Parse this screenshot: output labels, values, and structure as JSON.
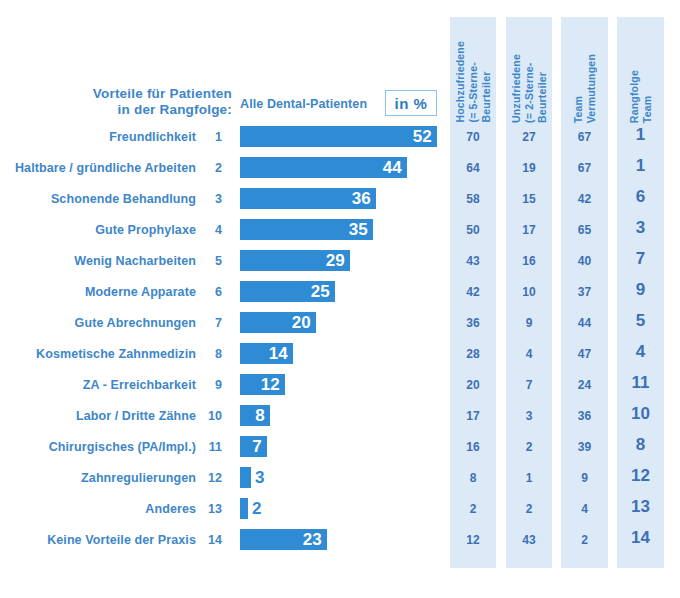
{
  "title": {
    "line1": "Vorteile für Patienten",
    "line2": "in der Rangfolge:"
  },
  "series_label": "Alle Dental-Patienten",
  "unit_label": "in %",
  "column_headers": [
    "Hochzufriedene\n(= 5-Sterne-\nBeurteiler",
    "Unzufriedene\n(= 2-Sterne-\nBeurteiler",
    "Team\nVermutungen",
    "Rangfolge\nTeam"
  ],
  "column_headers_lines": [
    [
      "Hochzufriedene",
      "(= 5-Sterne-",
      "Beurteiler"
    ],
    [
      "Unzufriedene",
      "(= 2-Sterne-",
      "Beurteiler"
    ],
    [
      "Team",
      "Vermutungen"
    ],
    [
      "Rangfolge",
      "Team"
    ]
  ],
  "colors": {
    "bar": "#2E8BD4",
    "label_text": "#3E86C8",
    "column_bg": "#DCEAF7",
    "column_text": "#3E6FB5",
    "unit_border": "#8FC2E8",
    "value_inside": "#ffffff"
  },
  "chart_data": {
    "type": "bar",
    "title": "Vorteile für Patienten in der Rangfolge:",
    "xlabel": "",
    "ylabel": "",
    "unit": "in %",
    "orientation": "horizontal",
    "xlim": [
      0,
      55
    ],
    "grid": false,
    "legend": "none",
    "categories": [
      "Freundlichkeit",
      "Haltbare / gründliche Arbeiten",
      "Schonende Behandlung",
      "Gute Prophylaxe",
      "Wenig Nacharbeiten",
      "Moderne Apparate",
      "Gute Abrechnungen",
      "Kosmetische Zahnmedizin",
      "ZA - Erreichbarkeit",
      "Labor / Dritte Zähne",
      "Chirurgisches (PA/Impl.)",
      "Zahnregulierungen",
      "Anderes",
      "Keine Vorteile der Praxis"
    ],
    "rank_numbers": [
      1,
      2,
      3,
      4,
      5,
      6,
      7,
      8,
      9,
      10,
      11,
      12,
      13,
      14
    ],
    "series": [
      {
        "name": "Alle Dental-Patienten",
        "values": [
          52,
          44,
          36,
          35,
          29,
          25,
          20,
          14,
          12,
          8,
          7,
          3,
          2,
          23
        ]
      },
      {
        "name": "Hochzufriedene (= 5-Sterne-Beurteiler",
        "values": [
          70,
          64,
          58,
          50,
          43,
          42,
          36,
          28,
          20,
          17,
          16,
          8,
          2,
          12
        ]
      },
      {
        "name": "Unzufriedene (= 2-Sterne-Beurteiler",
        "values": [
          27,
          19,
          15,
          17,
          16,
          10,
          9,
          4,
          7,
          3,
          2,
          1,
          2,
          43
        ]
      },
      {
        "name": "Team Vermutungen",
        "values": [
          67,
          67,
          42,
          65,
          40,
          37,
          44,
          47,
          24,
          36,
          39,
          9,
          4,
          2
        ]
      },
      {
        "name": "Rangfolge Team",
        "values": [
          1,
          1,
          6,
          3,
          7,
          9,
          5,
          4,
          11,
          10,
          8,
          12,
          13,
          14
        ]
      }
    ]
  }
}
